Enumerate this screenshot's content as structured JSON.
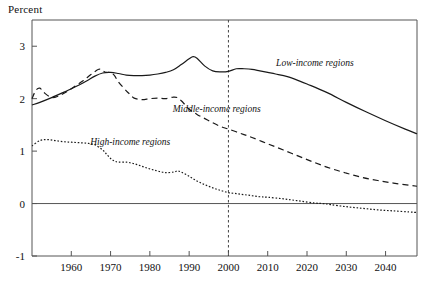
{
  "chart_data": {
    "type": "line",
    "title": "",
    "subtitle": "",
    "xlabel": "",
    "ylabel": "Percent",
    "xlim": [
      1950,
      2048
    ],
    "ylim": [
      -1,
      3.5
    ],
    "grid": false,
    "legend_position": "inline-annotations",
    "x_ticks": [
      1960,
      1970,
      1980,
      1990,
      2000,
      2010,
      2020,
      2030,
      2040
    ],
    "x_tick_labels": [
      "1960",
      "1970",
      "1980",
      "1990",
      "2000",
      "2010",
      "2020",
      "2030",
      "2040"
    ],
    "y_ticks": [
      -1,
      0,
      1,
      2,
      3
    ],
    "y_tick_labels": [
      "-1",
      "0",
      "1",
      "2",
      "3"
    ],
    "annotations": [
      {
        "text": "Low-income regions",
        "x": 2022,
        "y": 2.62,
        "style": "italic"
      },
      {
        "text": "Middle-income regions",
        "x": 1997,
        "y": 1.75,
        "style": "italic"
      },
      {
        "text": "High-income regions",
        "x": 1975,
        "y": 1.12,
        "style": "italic"
      }
    ],
    "reference_lines": [
      {
        "orientation": "vertical",
        "value": 2000,
        "style": "dashed",
        "label": "2000"
      },
      {
        "orientation": "horizontal",
        "value": 0,
        "style": "solid",
        "label": "0"
      }
    ],
    "series": [
      {
        "name": "Low-income regions",
        "style": "solid",
        "x": [
          1950,
          1952,
          1955,
          1958,
          1960,
          1962,
          1964,
          1966,
          1968,
          1970,
          1972,
          1974,
          1976,
          1978,
          1980,
          1982,
          1984,
          1986,
          1988,
          1990,
          1991,
          1992,
          1994,
          1996,
          1998,
          2000,
          2002,
          2004,
          2006,
          2008,
          2010,
          2012,
          2015,
          2018,
          2020,
          2025,
          2030,
          2035,
          2040,
          2045,
          2048
        ],
        "y": [
          1.88,
          1.93,
          2.02,
          2.12,
          2.19,
          2.26,
          2.34,
          2.43,
          2.49,
          2.5,
          2.48,
          2.45,
          2.44,
          2.44,
          2.45,
          2.47,
          2.5,
          2.55,
          2.65,
          2.76,
          2.8,
          2.77,
          2.62,
          2.53,
          2.51,
          2.52,
          2.57,
          2.57,
          2.56,
          2.53,
          2.5,
          2.47,
          2.42,
          2.34,
          2.28,
          2.12,
          1.93,
          1.75,
          1.58,
          1.42,
          1.33
        ]
      },
      {
        "name": "Middle-income regions",
        "style": "dashed",
        "x": [
          1950,
          1951,
          1952,
          1953,
          1955,
          1957,
          1959,
          1961,
          1963,
          1965,
          1967,
          1968,
          1969,
          1970,
          1971,
          1972,
          1974,
          1975,
          1976,
          1978,
          1980,
          1982,
          1984,
          1986,
          1987,
          1988,
          1989,
          1990,
          1992,
          1994,
          1996,
          1998,
          2000,
          2003,
          2006,
          2010,
          2014,
          2018,
          2022,
          2026,
          2030,
          2034,
          2038,
          2042,
          2046,
          2048
        ],
        "y": [
          2.0,
          2.16,
          2.2,
          2.12,
          2.02,
          2.06,
          2.14,
          2.24,
          2.34,
          2.46,
          2.56,
          2.53,
          2.5,
          2.5,
          2.44,
          2.32,
          2.15,
          2.08,
          2.01,
          1.98,
          2.0,
          2.01,
          2.0,
          2.03,
          2.02,
          1.96,
          1.88,
          1.8,
          1.7,
          1.62,
          1.54,
          1.47,
          1.42,
          1.34,
          1.26,
          1.14,
          1.02,
          0.9,
          0.78,
          0.67,
          0.58,
          0.5,
          0.44,
          0.39,
          0.35,
          0.33
        ]
      },
      {
        "name": "High-income regions",
        "style": "dotted",
        "x": [
          1950,
          1952,
          1954,
          1956,
          1958,
          1960,
          1962,
          1964,
          1966,
          1968,
          1969,
          1970,
          1971,
          1972,
          1974,
          1976,
          1978,
          1980,
          1982,
          1984,
          1986,
          1987,
          1988,
          1990,
          1992,
          1994,
          1996,
          1998,
          2000,
          2002,
          2004,
          2006,
          2008,
          2010,
          2014,
          2018,
          2022,
          2024,
          2026,
          2030,
          2034,
          2038,
          2042,
          2046,
          2048
        ],
        "y": [
          1.1,
          1.2,
          1.22,
          1.2,
          1.18,
          1.17,
          1.16,
          1.15,
          1.12,
          1.02,
          0.94,
          0.86,
          0.81,
          0.79,
          0.79,
          0.76,
          0.71,
          0.66,
          0.62,
          0.59,
          0.6,
          0.62,
          0.6,
          0.52,
          0.43,
          0.36,
          0.3,
          0.25,
          0.21,
          0.19,
          0.17,
          0.15,
          0.13,
          0.12,
          0.09,
          0.05,
          0.01,
          0.0,
          -0.02,
          -0.06,
          -0.09,
          -0.12,
          -0.14,
          -0.16,
          -0.17
        ]
      }
    ]
  }
}
